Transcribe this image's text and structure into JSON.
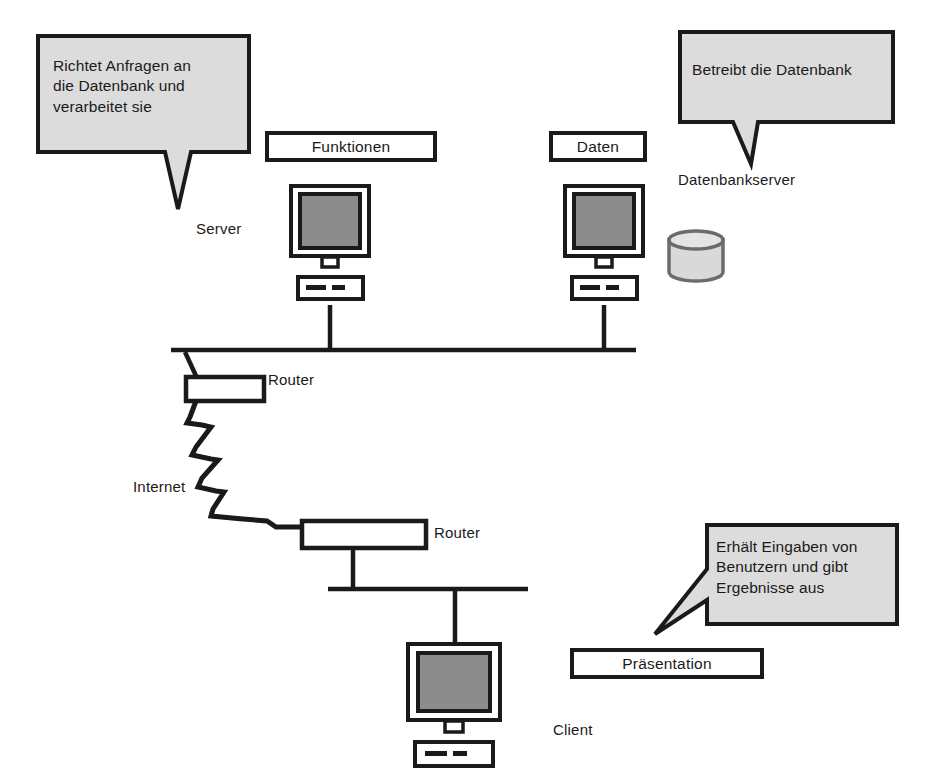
{
  "diagram": {
    "language": "de",
    "background_color": "#ffffff",
    "line_color": "#1a1a1a",
    "callout_fill": "#dcdcdc",
    "screen_fill": "#8c8c8c",
    "cylinder_fill": "#d9d9d9",
    "cylinder_stroke": "#6b6b6b"
  },
  "callouts": [
    {
      "id": "server-callout",
      "text": "Richtet Anfragen an die Datenbank und verarbeitet sie",
      "lines": [
        "Richtet Anfragen an",
        "die Datenbank und",
        "verarbeitet sie"
      ],
      "points_to": "Server"
    },
    {
      "id": "database-callout",
      "text": "Betreibt die Datenbank",
      "lines": [
        "Betreibt die Datenbank"
      ],
      "points_to": "Datenbankserver"
    },
    {
      "id": "client-callout",
      "text": "Erhält Eingaben von Benutzern und gibt Ergebnisse aus",
      "lines": [
        "Erhält Eingaben von",
        "Benutzern und gibt",
        "Ergebnisse aus"
      ],
      "points_to": "Client"
    }
  ],
  "layer_boxes": [
    {
      "id": "funktionen",
      "label": "Funktionen"
    },
    {
      "id": "daten",
      "label": "Daten"
    },
    {
      "id": "praesentation",
      "label": "Präsentation"
    }
  ],
  "node_labels": {
    "server": "Server",
    "database_server": "Datenbankserver",
    "router_top": "Router",
    "router_bottom": "Router",
    "internet": "Internet",
    "client": "Client"
  },
  "nodes": [
    {
      "id": "server-computer",
      "type": "computer",
      "layer_label": "Funktionen",
      "name": "Server"
    },
    {
      "id": "data-computer",
      "type": "computer",
      "layer_label": "Daten",
      "name": "Datenbankserver"
    },
    {
      "id": "database-cylinder",
      "type": "database",
      "name": "Datenbankserver"
    },
    {
      "id": "router-top",
      "type": "router",
      "name": "Router"
    },
    {
      "id": "router-bottom",
      "type": "router",
      "name": "Router"
    },
    {
      "id": "client-computer",
      "type": "computer",
      "layer_label": "Präsentation",
      "name": "Client"
    }
  ],
  "connections": [
    {
      "from": "server-computer",
      "to": "bus-top",
      "style": "solid"
    },
    {
      "from": "data-computer",
      "to": "bus-top",
      "style": "solid"
    },
    {
      "from": "bus-top",
      "to": "router-top",
      "style": "solid"
    },
    {
      "from": "router-top",
      "to": "router-bottom",
      "style": "zigzag",
      "label": "Internet"
    },
    {
      "from": "router-bottom",
      "to": "bus-bottom",
      "style": "solid"
    },
    {
      "from": "bus-bottom",
      "to": "client-computer",
      "style": "solid"
    }
  ]
}
